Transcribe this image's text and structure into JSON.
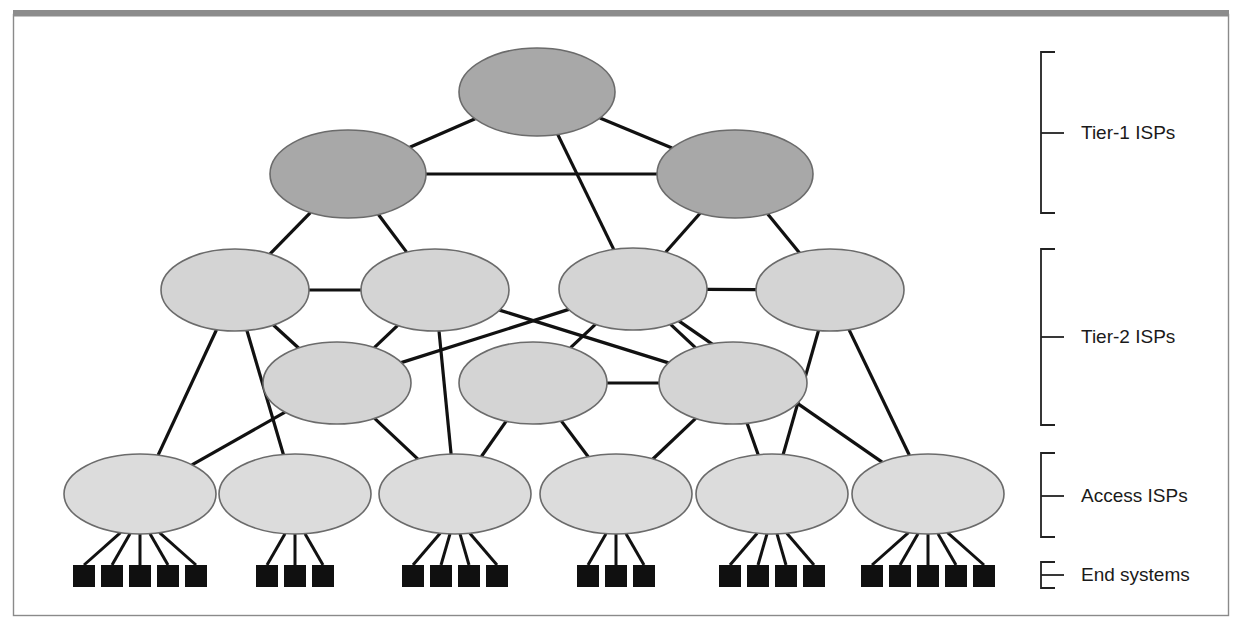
{
  "figure": {
    "frame": {
      "border_color": "#8a8a8a",
      "top_bar_color": "#8c8c8c",
      "background": "#ffffff"
    }
  },
  "legend": {
    "brackets": [
      {
        "id": "tier1",
        "label": "Tier-1 ISPs",
        "top": 52,
        "bottom": 213,
        "tick": 133
      },
      {
        "id": "tier2",
        "label": "Tier-2 ISPs",
        "top": 249,
        "bottom": 425,
        "tick": 337
      },
      {
        "id": "access",
        "label": "Access ISPs",
        "top": 453,
        "bottom": 537,
        "tick": 496
      },
      {
        "id": "endsys",
        "label": "End systems",
        "top": 562,
        "bottom": 588,
        "tick": 575
      }
    ]
  },
  "colors": {
    "tier1_fill": "#a8a8a8",
    "tier2_fill": "#d4d4d4",
    "access_fill": "#dcdcdc",
    "node_stroke": "#6b6b6b",
    "edge": "#111111",
    "end_system_fill": "#101010"
  },
  "network": {
    "tier1_nodes": [
      {
        "id": "t1-top",
        "cx": 537,
        "cy": 92,
        "rx": 78,
        "ry": 44
      },
      {
        "id": "t1-left",
        "cx": 348,
        "cy": 174,
        "rx": 78,
        "ry": 44
      },
      {
        "id": "t1-right",
        "cx": 735,
        "cy": 174,
        "rx": 78,
        "ry": 44
      }
    ],
    "tier2_nodes": [
      {
        "id": "t2-a",
        "cx": 235,
        "cy": 290,
        "rx": 74,
        "ry": 41
      },
      {
        "id": "t2-b",
        "cx": 435,
        "cy": 290,
        "rx": 74,
        "ry": 41
      },
      {
        "id": "t2-c",
        "cx": 633,
        "cy": 289,
        "rx": 74,
        "ry": 41
      },
      {
        "id": "t2-d",
        "cx": 830,
        "cy": 290,
        "rx": 74,
        "ry": 41
      },
      {
        "id": "t2-e",
        "cx": 337,
        "cy": 383,
        "rx": 74,
        "ry": 41
      },
      {
        "id": "t2-f",
        "cx": 533,
        "cy": 383,
        "rx": 74,
        "ry": 41
      },
      {
        "id": "t2-g",
        "cx": 733,
        "cy": 383,
        "rx": 74,
        "ry": 41
      }
    ],
    "access_nodes": [
      {
        "id": "acc-1",
        "cx": 140,
        "cy": 494,
        "rx": 76,
        "ry": 40,
        "end_systems": 5
      },
      {
        "id": "acc-2",
        "cx": 295,
        "cy": 494,
        "rx": 76,
        "ry": 40,
        "end_systems": 3
      },
      {
        "id": "acc-3",
        "cx": 455,
        "cy": 494,
        "rx": 76,
        "ry": 40,
        "end_systems": 4
      },
      {
        "id": "acc-4",
        "cx": 616,
        "cy": 494,
        "rx": 76,
        "ry": 40,
        "end_systems": 3
      },
      {
        "id": "acc-5",
        "cx": 772,
        "cy": 494,
        "rx": 76,
        "ry": 40,
        "end_systems": 4
      },
      {
        "id": "acc-6",
        "cx": 928,
        "cy": 494,
        "rx": 76,
        "ry": 40,
        "end_systems": 5
      }
    ],
    "end_system_box": {
      "w": 22,
      "h": 22,
      "y": 565,
      "spacing": 28
    },
    "links": [
      [
        "t1-top",
        "t1-left"
      ],
      [
        "t1-top",
        "t1-right"
      ],
      [
        "t1-left",
        "t1-right"
      ],
      [
        "t1-top",
        "t2-c"
      ],
      [
        "t1-left",
        "t2-a"
      ],
      [
        "t1-left",
        "t2-b"
      ],
      [
        "t1-right",
        "t2-c"
      ],
      [
        "t1-right",
        "t2-d"
      ],
      [
        "t2-a",
        "t2-b"
      ],
      [
        "t2-c",
        "t2-d"
      ],
      [
        "t2-a",
        "t2-e"
      ],
      [
        "t2-b",
        "t2-e"
      ],
      [
        "t2-b",
        "t2-g"
      ],
      [
        "t2-c",
        "t2-e"
      ],
      [
        "t2-c",
        "t2-f"
      ],
      [
        "t2-c",
        "t2-g"
      ],
      [
        "t2-f",
        "t2-g"
      ],
      [
        "t2-a",
        "acc-1"
      ],
      [
        "t2-a",
        "acc-2"
      ],
      [
        "t2-e",
        "acc-1"
      ],
      [
        "t2-e",
        "acc-3"
      ],
      [
        "t2-b",
        "acc-3"
      ],
      [
        "t2-f",
        "acc-3"
      ],
      [
        "t2-f",
        "acc-4"
      ],
      [
        "t2-g",
        "acc-4"
      ],
      [
        "t2-g",
        "acc-5"
      ],
      [
        "t2-d",
        "acc-5"
      ],
      [
        "t2-d",
        "acc-6"
      ],
      [
        "t2-c",
        "acc-6"
      ]
    ]
  }
}
